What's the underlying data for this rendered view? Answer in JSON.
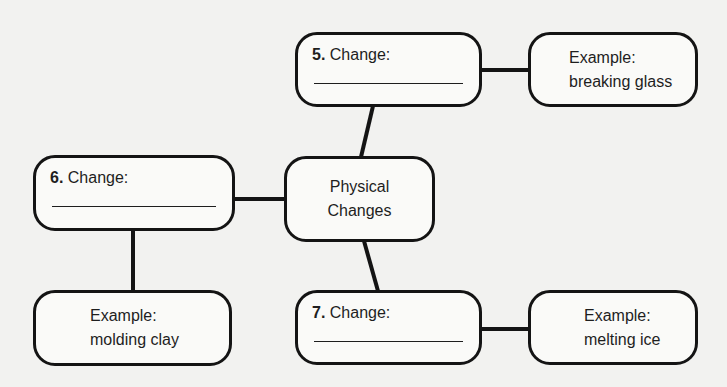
{
  "diagram": {
    "center": {
      "line1": "Physical",
      "line2": "Changes"
    },
    "change_nodes": [
      {
        "number": "5.",
        "label": "Change:",
        "answer": ""
      },
      {
        "number": "6.",
        "label": "Change:",
        "answer": ""
      },
      {
        "number": "7.",
        "label": "Change:",
        "answer": ""
      }
    ],
    "example_nodes": [
      {
        "title": "Example:",
        "value": "breaking glass"
      },
      {
        "title": "Example:",
        "value": "molding clay"
      },
      {
        "title": "Example:",
        "value": "melting ice"
      }
    ]
  },
  "colors": {
    "background": "#f2f2f0",
    "stroke": "#141414",
    "text": "#1e1e1e"
  }
}
